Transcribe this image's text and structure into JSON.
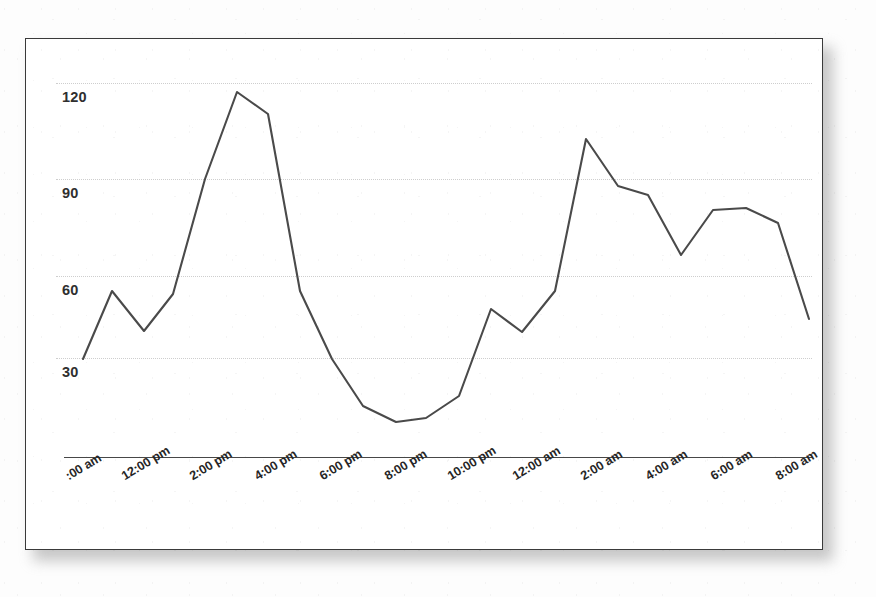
{
  "chart_data": {
    "type": "line",
    "title": "",
    "subtitle": "",
    "xlabel": "",
    "ylabel": "",
    "grid": true,
    "legend": "none",
    "ylim": [
      0,
      132
    ],
    "yticks": [
      30,
      60,
      90,
      120
    ],
    "ytick_labels": [
      "30",
      "60",
      "90",
      "120"
    ],
    "x": [
      "10:00 am",
      "11:00 am",
      "12:00 pm",
      "1:00 pm",
      "2:00 pm",
      "3:00 pm",
      "4:00 pm",
      "5:00 pm",
      "6:00 pm",
      "7:00 pm",
      "8:00 pm",
      "9:00 pm",
      "10:00 pm",
      "11:00 pm",
      "12:00 am",
      "1:00 am",
      "2:00 am",
      "3:00 am",
      "4:00 am",
      "5:00 am",
      "6:00 am",
      "7:00 am",
      "8:00 am",
      "9:00 am"
    ],
    "xtick_labels": [
      ":00 am",
      "12:00 pm",
      "2:00 pm",
      "4:00 pm",
      "6:00 pm",
      "8:00 pm",
      "10:00 pm",
      "12:00 am",
      "2:00 am",
      "4:00 am",
      "6:00 am",
      "8:00 am"
    ],
    "xtick_first_label_clipped": true,
    "values": [
      30,
      58,
      44,
      58,
      90,
      120,
      113,
      58,
      37,
      26,
      20,
      17,
      18,
      22,
      27,
      51,
      44,
      58,
      105,
      91,
      88,
      67,
      82,
      83
    ],
    "series": [
      {
        "name": "",
        "color": "#4a4a4a",
        "values": [
          30,
          58,
          44,
          58,
          90,
          120,
          113,
          58,
          37,
          26,
          20,
          17,
          18,
          22,
          27,
          51,
          44,
          58,
          105,
          91,
          88,
          67,
          82,
          83
        ]
      }
    ],
    "tail_values": [
      78,
      48
    ],
    "min_value": 17,
    "max_value": 120,
    "line_color": "#4a4a4a",
    "gridline_color": "#c9c9c9",
    "axis_color": "#474747",
    "panel_border_color": "#3a3a3a",
    "background_color": "#ffffff"
  },
  "points": [
    {
      "x": 82,
      "y": 358,
      "v": 30
    },
    {
      "x": 111,
      "y": 290,
      "v": 58
    },
    {
      "x": 143,
      "y": 330,
      "v": 44
    },
    {
      "x": 172,
      "y": 293,
      "v": 58
    },
    {
      "x": 204,
      "y": 178,
      "v": 90
    },
    {
      "x": 236,
      "y": 91,
      "v": 120
    },
    {
      "x": 267,
      "y": 113,
      "v": 113
    },
    {
      "x": 299,
      "y": 290,
      "v": 58
    },
    {
      "x": 331,
      "y": 358,
      "v": 37
    },
    {
      "x": 362,
      "y": 405,
      "v": 26
    },
    {
      "x": 395,
      "y": 421,
      "v": 17
    },
    {
      "x": 425,
      "y": 417,
      "v": 18
    },
    {
      "x": 458,
      "y": 395,
      "v": 27
    },
    {
      "x": 490,
      "y": 308,
      "v": 51
    },
    {
      "x": 521,
      "y": 331,
      "v": 44
    },
    {
      "x": 554,
      "y": 290,
      "v": 58
    },
    {
      "x": 585,
      "y": 138,
      "v": 105
    },
    {
      "x": 617,
      "y": 185,
      "v": 91
    },
    {
      "x": 647,
      "y": 194,
      "v": 88
    },
    {
      "x": 680,
      "y": 254,
      "v": 67
    },
    {
      "x": 712,
      "y": 209,
      "v": 82
    },
    {
      "x": 745,
      "y": 207,
      "v": 83
    },
    {
      "x": 777,
      "y": 222,
      "v": 78
    },
    {
      "x": 808,
      "y": 318,
      "v": 48
    }
  ],
  "gridlines": [
    {
      "label": "120",
      "y": 82
    },
    {
      "label": "90",
      "y": 178
    },
    {
      "label": "60",
      "y": 275
    },
    {
      "label": "30",
      "y": 357
    }
  ],
  "xticks": [
    {
      "label": ":00 am",
      "x": 62
    },
    {
      "label": "12:00 pm",
      "x": 118
    },
    {
      "label": "2:00 pm",
      "x": 186
    },
    {
      "label": "4:00 pm",
      "x": 251
    },
    {
      "label": "6:00 pm",
      "x": 316
    },
    {
      "label": "8:00 pm",
      "x": 381
    },
    {
      "label": "10:00 pm",
      "x": 444
    },
    {
      "label": "12:00 am",
      "x": 509
    },
    {
      "label": "2:00 am",
      "x": 577
    },
    {
      "label": "4:00 am",
      "x": 642
    },
    {
      "label": "6:00 am",
      "x": 707
    },
    {
      "label": "8:00 am",
      "x": 772
    }
  ]
}
